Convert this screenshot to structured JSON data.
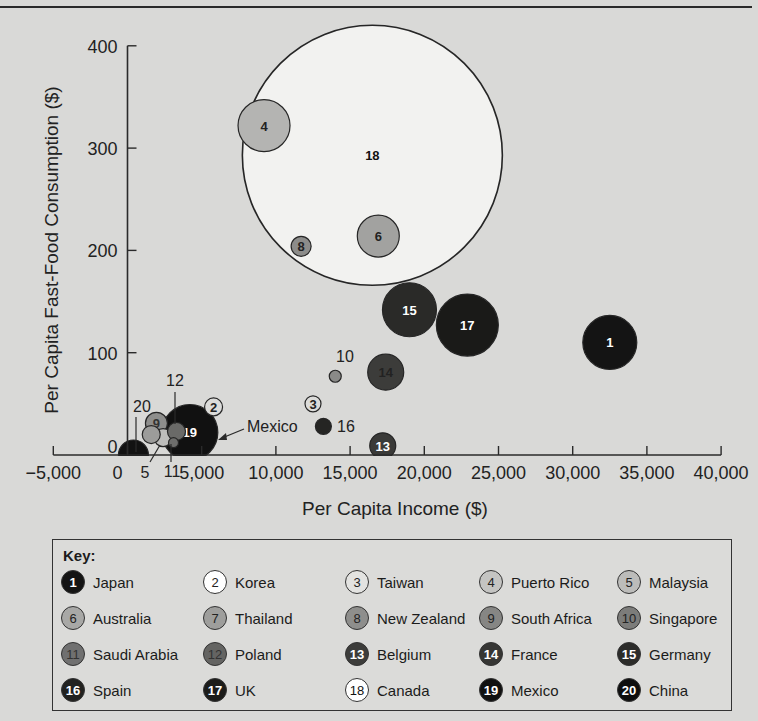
{
  "chart_data": {
    "type": "scatter",
    "subtype": "bubble",
    "title": "",
    "xlabel": "Per Capita Income ($)",
    "ylabel": "Per Capita Fast-Food Consumption ($)",
    "xlim": [
      -5000,
      40000
    ],
    "ylim": [
      0,
      400
    ],
    "xticks": [
      -5000,
      0,
      5000,
      10000,
      15000,
      20000,
      25000,
      30000,
      35000,
      40000
    ],
    "xtick_labels": [
      "−5,000",
      "0",
      "5,000",
      "10,000",
      "15,000",
      "20,000",
      "25,000",
      "30,000",
      "35,000",
      "40,000"
    ],
    "yticks": [
      0,
      100,
      200,
      300,
      400
    ],
    "ytick_labels": [
      "0",
      "100",
      "200",
      "300",
      "400"
    ],
    "grid": false,
    "legend_title": "Key:",
    "legend_position": "bottom",
    "points": [
      {
        "id": 1,
        "name": "Japan",
        "x": 32500,
        "y": 110,
        "size": 27,
        "fill": "#141414",
        "text_color": "#ffffff",
        "label_inside": true
      },
      {
        "id": 2,
        "name": "Korea",
        "x": 5800,
        "y": 47,
        "size": 9,
        "fill": "#dcdcda",
        "text_color": "#222222",
        "label_inside": true
      },
      {
        "id": 3,
        "name": "Taiwan",
        "x": 12500,
        "y": 50,
        "size": 8,
        "fill": "#dcdcda",
        "text_color": "#222222",
        "label_inside": true
      },
      {
        "id": 4,
        "name": "Puerto Rico",
        "x": 9200,
        "y": 322,
        "size": 26,
        "fill": "#b4b4b2",
        "text_color": "#222222",
        "label_inside": true
      },
      {
        "id": 5,
        "name": "Malaysia",
        "x": 2400,
        "y": 17,
        "size": 9,
        "fill": "#bdbdbb",
        "text_color": "#222222",
        "label_inside": false
      },
      {
        "id": 6,
        "name": "Australia",
        "x": 16900,
        "y": 214,
        "size": 21,
        "fill": "#a2a2a0",
        "text_color": "#222222",
        "label_inside": true
      },
      {
        "id": 7,
        "name": "Thailand",
        "x": 1600,
        "y": 20,
        "size": 9,
        "fill": "#9c9c9a",
        "text_color": "#222222",
        "label_inside": false
      },
      {
        "id": 8,
        "name": "New Zealand",
        "x": 11700,
        "y": 204,
        "size": 10,
        "fill": "#8c8c8a",
        "text_color": "#222222",
        "label_inside": true
      },
      {
        "id": 9,
        "name": "South Africa",
        "x": 1950,
        "y": 31,
        "size": 11,
        "fill": "#8e8e8c",
        "text_color": "#333333",
        "label_inside": true
      },
      {
        "id": 10,
        "name": "Singapore",
        "x": 14000,
        "y": 77,
        "size": 6,
        "fill": "#8a8a88",
        "text_color": "#222222",
        "label_inside": false
      },
      {
        "id": 11,
        "name": "Saudi Arabia",
        "x": 3100,
        "y": 12,
        "size": 5,
        "fill": "#6e6e6c",
        "text_color": "#222222",
        "label_inside": false
      },
      {
        "id": 12,
        "name": "Poland",
        "x": 3300,
        "y": 23,
        "size": 9,
        "fill": "#6a6a68",
        "text_color": "#222222",
        "label_inside": false
      },
      {
        "id": 13,
        "name": "Belgium",
        "x": 17200,
        "y": 9,
        "size": 13,
        "fill": "#3a3a38",
        "text_color": "#ffffff",
        "label_inside": true
      },
      {
        "id": 14,
        "name": "France",
        "x": 17400,
        "y": 81,
        "size": 18,
        "fill": "#3c3c3a",
        "text_color": "#222222",
        "label_inside": true
      },
      {
        "id": 15,
        "name": "Germany",
        "x": 19000,
        "y": 142,
        "size": 27,
        "fill": "#2a2a28",
        "text_color": "#ffffff",
        "label_inside": true
      },
      {
        "id": 16,
        "name": "Spain",
        "x": 13200,
        "y": 28,
        "size": 8,
        "fill": "#252523",
        "text_color": "#ffffff",
        "label_inside": false
      },
      {
        "id": 17,
        "name": "UK",
        "x": 22900,
        "y": 127,
        "size": 31,
        "fill": "#1a1a18",
        "text_color": "#ffffff",
        "label_inside": true
      },
      {
        "id": 18,
        "name": "Canada",
        "x": 16500,
        "y": 293,
        "size": 130,
        "fill": "#f2f2f0",
        "text_color": "#111111",
        "label_inside": true
      },
      {
        "id": 19,
        "name": "Mexico",
        "x": 4200,
        "y": 22,
        "size": 28,
        "fill": "#111111",
        "text_color": "#ffffff",
        "label_inside": true
      },
      {
        "id": 20,
        "name": "China",
        "x": 400,
        "y": 0,
        "size": 15,
        "fill": "#121212",
        "text_color": "#ffffff",
        "label_inside": false
      }
    ],
    "annotations": [
      {
        "text": "20",
        "target": 20
      },
      {
        "text": "5",
        "target": 5
      },
      {
        "text": "12",
        "target": 12
      },
      {
        "text": "11",
        "target": 11
      },
      {
        "text": "10",
        "target": 10
      },
      {
        "text": "16",
        "target": 16
      },
      {
        "text": "Mexico",
        "target": 19,
        "arrow": true
      }
    ]
  },
  "key": {
    "title": "Key:",
    "items": [
      {
        "id": "1",
        "name": "Japan",
        "fill": "#141414",
        "text_color": "#ffffff"
      },
      {
        "id": "2",
        "name": "Korea",
        "fill": "#ffffff",
        "text_color": "#222222"
      },
      {
        "id": "3",
        "name": "Taiwan",
        "fill": "#e3e3e1",
        "text_color": "#222222"
      },
      {
        "id": "4",
        "name": "Puerto Rico",
        "fill": "#c4c4c2",
        "text_color": "#222222"
      },
      {
        "id": "5",
        "name": "Malaysia",
        "fill": "#bcbcba",
        "text_color": "#222222"
      },
      {
        "id": "6",
        "name": "Australia",
        "fill": "#a8a8a6",
        "text_color": "#222222"
      },
      {
        "id": "7",
        "name": "Thailand",
        "fill": "#9e9e9c",
        "text_color": "#222222"
      },
      {
        "id": "8",
        "name": "New Zealand",
        "fill": "#8e8e8c",
        "text_color": "#222222"
      },
      {
        "id": "9",
        "name": "South Africa",
        "fill": "#868684",
        "text_color": "#222222"
      },
      {
        "id": "10",
        "name": "Singapore",
        "fill": "#7c7c7a",
        "text_color": "#222222"
      },
      {
        "id": "11",
        "name": "Saudi Arabia",
        "fill": "#707070",
        "text_color": "#333333"
      },
      {
        "id": "12",
        "name": "Poland",
        "fill": "#646462",
        "text_color": "#333333"
      },
      {
        "id": "13",
        "name": "Belgium",
        "fill": "#3c3c3a",
        "text_color": "#ffffff"
      },
      {
        "id": "14",
        "name": "France",
        "fill": "#363634",
        "text_color": "#ffffff"
      },
      {
        "id": "15",
        "name": "Germany",
        "fill": "#2c2c2a",
        "text_color": "#ffffff"
      },
      {
        "id": "16",
        "name": "Spain",
        "fill": "#222220",
        "text_color": "#ffffff"
      },
      {
        "id": "17",
        "name": "UK",
        "fill": "#1c1c1a",
        "text_color": "#ffffff"
      },
      {
        "id": "18",
        "name": "Canada",
        "fill": "#ffffff",
        "text_color": "#111111"
      },
      {
        "id": "19",
        "name": "Mexico",
        "fill": "#111111",
        "text_color": "#ffffff"
      },
      {
        "id": "20",
        "name": "China",
        "fill": "#0e0e0e",
        "text_color": "#ffffff"
      }
    ]
  }
}
